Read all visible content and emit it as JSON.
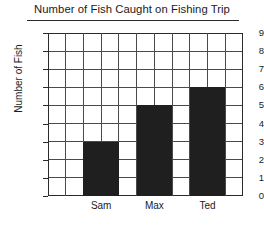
{
  "chart_data": {
    "type": "bar",
    "title": "Number of Fish Caught on Fishing Trip",
    "xlabel": "",
    "ylabel": "Number of Fish",
    "categories": [
      "Sam",
      "Max",
      "Ted"
    ],
    "values": [
      3,
      5,
      6
    ],
    "ylim": [
      0,
      9
    ],
    "ytick_labels": [
      "0",
      "1",
      "2",
      "3",
      "4",
      "5",
      "6",
      "7",
      "8",
      "9"
    ],
    "ytick_values": [
      0,
      1,
      2,
      3,
      4,
      5,
      6,
      7,
      8,
      9
    ],
    "grid": true,
    "grid_columns": 11,
    "legend": null,
    "legend_position": "none",
    "bar_color": "#1f1f1f",
    "grid_color": "#4a4a4a",
    "axis_color": "#2b2b2b",
    "background_color": "#ffffff"
  }
}
